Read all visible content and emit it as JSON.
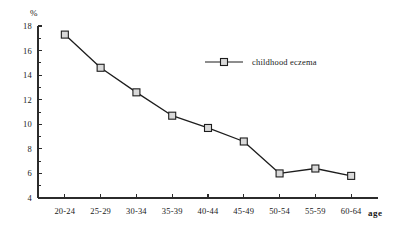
{
  "chart_data": {
    "type": "line",
    "title": "",
    "xlabel": "age",
    "ylabel": "%",
    "ylim": [
      4,
      18
    ],
    "ytick_step": 2,
    "yticks": [
      "4",
      "6",
      "8",
      "10",
      "12",
      "14",
      "16",
      "18"
    ],
    "minor_ticks": true,
    "grid": false,
    "legend_position": "top-right",
    "categories": [
      "20-24",
      "25-29",
      "30-34",
      "35-39",
      "40-44",
      "45-49",
      "50-54",
      "55-59",
      "60-64"
    ],
    "series": [
      {
        "name": "childhood eczema",
        "marker": "square",
        "values": [
          17.3,
          14.6,
          12.6,
          10.7,
          9.7,
          8.6,
          6.0,
          6.4,
          5.8
        ]
      }
    ],
    "colors": {
      "line": "#1d1d1d",
      "marker_fill": "#d9d9d9",
      "axis": "#2b2b2b",
      "background": "#ffffff"
    }
  }
}
